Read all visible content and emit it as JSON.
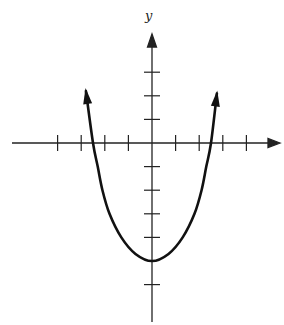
{
  "chart_data": {
    "type": "line",
    "title": "",
    "xlabel": "",
    "ylabel": "y",
    "grid": false,
    "legend": null,
    "axis_ranges": {
      "x": [
        -6,
        5.5
      ],
      "y": [
        -7.6,
        4.6
      ]
    },
    "x_ticks": [
      -4,
      -3,
      -2,
      -1,
      1,
      2,
      3,
      4
    ],
    "y_ticks": [
      -6,
      -4,
      -3,
      -2,
      -1,
      1,
      2,
      3
    ],
    "tick_labels_shown": false,
    "series": [
      {
        "name": "curve",
        "description": "U-shaped curve with vertex at (0,-5), x-intercepts near ±2.5, arrows at both ends",
        "x": [
          -2.8,
          -2.5,
          -2.3,
          -2.1,
          -1.8,
          -1.3,
          -0.7,
          0,
          0.7,
          1.3,
          1.8,
          2.1,
          2.3,
          2.5,
          2.75
        ],
        "y": [
          2.2,
          0,
          -1,
          -2,
          -3,
          -4,
          -4.7,
          -5,
          -4.7,
          -4,
          -3,
          -2,
          -1,
          0,
          2.1
        ]
      }
    ],
    "pixel_map": {
      "origin_x": 152,
      "origin_y": 143,
      "unit_px": 23.6
    }
  },
  "labels": {
    "y_axis": "y"
  }
}
